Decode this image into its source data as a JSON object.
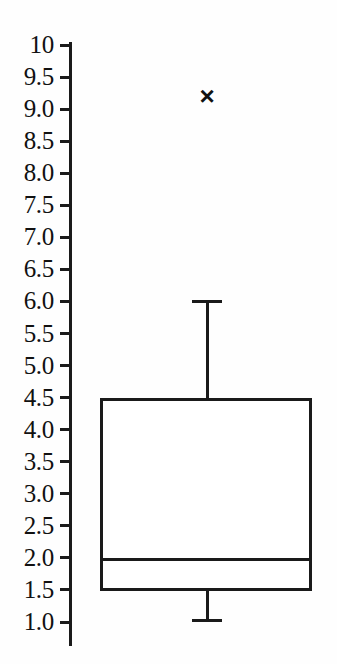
{
  "chart_data": {
    "type": "box",
    "title": "",
    "xlabel": "",
    "ylabel": "",
    "grid": false,
    "legend": false,
    "ylim": [
      1.0,
      10.0
    ],
    "y_tick_labels": [
      "10",
      "9.5",
      "9.0",
      "8.5",
      "8.0",
      "7.5",
      "7.0",
      "6.5",
      "6.0",
      "5.5",
      "5.0",
      "4.5",
      "4.0",
      "3.5",
      "3.0",
      "2.5",
      "2.0",
      "1.5",
      "1.0"
    ],
    "y_tick_values": [
      10.0,
      9.5,
      9.0,
      8.5,
      8.0,
      7.5,
      7.0,
      6.5,
      6.0,
      5.5,
      5.0,
      4.5,
      4.0,
      3.5,
      3.0,
      2.5,
      2.0,
      1.5,
      1.0
    ],
    "categories": [
      ""
    ],
    "boxes": [
      {
        "name": "",
        "whisker_low": 1.03,
        "q1": 1.48,
        "median": 1.97,
        "q3": 4.5,
        "whisker_high": 6.0,
        "outliers": [
          9.2
        ],
        "outlier_marker": "x",
        "box_fill": "#ffffff",
        "line_color": "#1a1a1a"
      }
    ]
  },
  "colors": {
    "background": "#fefefe",
    "line": "#1a1a1a",
    "text": "#111111"
  },
  "axis": {
    "outlier_glyph": "×"
  }
}
